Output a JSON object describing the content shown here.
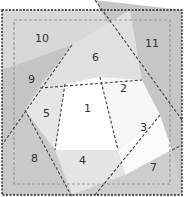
{
  "diagram": {
    "regions": [
      {
        "id": "1",
        "label": "1"
      },
      {
        "id": "2",
        "label": "2"
      },
      {
        "id": "3",
        "label": "3"
      },
      {
        "id": "4",
        "label": "4"
      },
      {
        "id": "5",
        "label": "5"
      },
      {
        "id": "6",
        "label": "6"
      },
      {
        "id": "7",
        "label": "7"
      },
      {
        "id": "8",
        "label": "8"
      },
      {
        "id": "9",
        "label": "9"
      },
      {
        "id": "10",
        "label": "10"
      },
      {
        "id": "11",
        "label": "11"
      }
    ],
    "colors": {
      "outer_border": "#c8c8c8",
      "dark_gray": "#bdbdbd",
      "mid_gray": "#d2d2d2",
      "light_gray": "#e2e2e2",
      "white": "#ffffff",
      "line": "#333333",
      "seam": "#999999"
    }
  }
}
